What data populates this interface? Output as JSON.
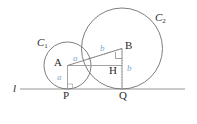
{
  "figure": {
    "type": "geometry-diagram",
    "colors": {
      "stroke": "#6f6f6f",
      "stroke_light": "#9a9a9a",
      "label": "#2b2b2b",
      "segment_label": "#7ba7d2",
      "background": "#ffffff"
    },
    "labels": {
      "line": "l",
      "circle_small": "C",
      "circle_small_sub": "1",
      "circle_large": "C",
      "circle_large_sub": "2",
      "center_small": "A",
      "center_large": "B",
      "tangent_small": "P",
      "tangent_large": "Q",
      "foot": "H",
      "radius_small_vertical": "a",
      "radius_small_slant": "a",
      "radius_large_slant": "b",
      "radius_large_vertical": "b"
    },
    "geometry": {
      "line_l": {
        "y": 89,
        "x1": 20,
        "x2": 185
      },
      "circle_small": {
        "cx": 67.5,
        "cy": 65.5,
        "r": 23.5
      },
      "circle_large": {
        "cx": 122,
        "cy": 48.5,
        "r": 40.5
      },
      "point_A": {
        "x": 67.5,
        "y": 65.5
      },
      "point_B": {
        "x": 122,
        "y": 48.5
      },
      "point_P": {
        "x": 67.5,
        "y": 89
      },
      "point_Q": {
        "x": 122,
        "y": 89
      },
      "point_H": {
        "x": 122,
        "y": 65.5
      }
    }
  }
}
